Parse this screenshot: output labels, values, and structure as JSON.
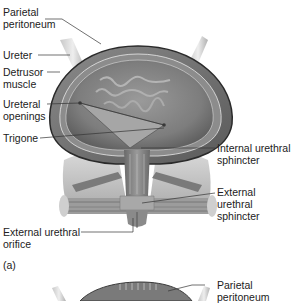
{
  "figure": {
    "panel_a_label": "(a)",
    "labels_left": [
      {
        "id": "parietal-peritoneum",
        "text": "Parietal\nperitoneum"
      },
      {
        "id": "ureter",
        "text": "Ureter"
      },
      {
        "id": "detrusor-muscle",
        "text": "Detrusor\nmuscle"
      },
      {
        "id": "ureteral-openings",
        "text": "Ureteral\nopenings"
      },
      {
        "id": "trigone",
        "text": "Trigone"
      },
      {
        "id": "external-urethral-orifice",
        "text": "External urethral\norifice"
      }
    ],
    "labels_right": [
      {
        "id": "internal-urethral-sphincter",
        "text": "Internal urethral\nsphincter"
      },
      {
        "id": "external-urethral-sphincter",
        "text": "External urethral\nsphincter"
      },
      {
        "id": "parietal-peritoneum-b",
        "text": "Parietal\nperitoneum"
      }
    ]
  }
}
